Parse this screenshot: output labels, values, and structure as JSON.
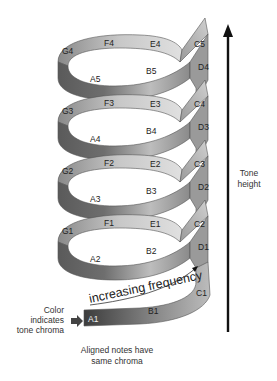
{
  "diagram": {
    "type": "pitch-helix",
    "axis_label": [
      "Tone",
      "height"
    ],
    "frequency_label": "increasing frequency",
    "chroma_label": [
      "Color",
      "indicates",
      "tone chroma"
    ],
    "aligned_caption": [
      "Aligned notes have",
      "same chroma"
    ],
    "turns": [
      {
        "front": [
          "A5",
          "B5"
        ],
        "back": [
          "G4",
          "F4",
          "E4"
        ],
        "right": [
          "C5",
          "D4"
        ]
      },
      {
        "front": [
          "A4",
          "B4"
        ],
        "back": [
          "G3",
          "F3",
          "E3"
        ],
        "right": [
          "C4",
          "D3"
        ]
      },
      {
        "front": [
          "A3",
          "B3"
        ],
        "back": [
          "G2",
          "F2",
          "E2"
        ],
        "right": [
          "C3",
          "D2"
        ]
      },
      {
        "front": [
          "A2",
          "B2"
        ],
        "back": [
          "G1",
          "F1",
          "E1"
        ],
        "right": [
          "C2",
          "D1"
        ]
      },
      {
        "front": [
          "A1",
          "B1"
        ],
        "back": [],
        "right": [
          "C1"
        ]
      }
    ],
    "colors": {
      "ribbon_dark": "#4a4a4a",
      "ribbon_light": "#d8d8d8",
      "arrow": "#111111"
    }
  }
}
